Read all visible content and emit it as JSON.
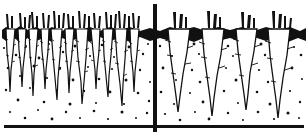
{
  "figure": {
    "medium": "black-and-white pen-and-ink line drawing",
    "canvas": {
      "width": 308,
      "height": 138
    },
    "colors": {
      "ink": "#111111",
      "paper": "#ffffff"
    },
    "divider": {
      "name": "vertical-divider-line",
      "orientation": "vertical",
      "x": 155,
      "y_top": 4,
      "y_bottom": 132,
      "thickness": 4
    },
    "baseline": {
      "name": "ground-baseline",
      "orientation": "horizontal",
      "y": 126,
      "x_start": 4,
      "x_end": 304,
      "thickness": 3
    },
    "soil_surface_y": 34,
    "panels": [
      {
        "id": "left",
        "label": "crowded unthinned carrots",
        "x_start": 0,
        "x_end": 155,
        "carrot_count": 11,
        "spacing": "crowded",
        "root_width": "narrow",
        "root_style": "thin spindly tapering taproots",
        "carrots": [
          {
            "x": 10,
            "top_w": 9,
            "depth": 62,
            "tuft": 3
          },
          {
            "x": 22,
            "top_w": 8,
            "depth": 58,
            "tuft": 3
          },
          {
            "x": 33,
            "top_w": 9,
            "depth": 66,
            "tuft": 4
          },
          {
            "x": 45,
            "top_w": 8,
            "depth": 60,
            "tuft": 3
          },
          {
            "x": 56,
            "top_w": 10,
            "depth": 70,
            "tuft": 4
          },
          {
            "x": 69,
            "top_w": 9,
            "depth": 64,
            "tuft": 3
          },
          {
            "x": 81,
            "top_w": 11,
            "depth": 74,
            "tuft": 4
          },
          {
            "x": 95,
            "top_w": 9,
            "depth": 60,
            "tuft": 3
          },
          {
            "x": 107,
            "top_w": 10,
            "depth": 68,
            "tuft": 4
          },
          {
            "x": 120,
            "top_w": 11,
            "depth": 76,
            "tuft": 4
          },
          {
            "x": 134,
            "top_w": 9,
            "depth": 62,
            "tuft": 3
          }
        ]
      },
      {
        "id": "right",
        "label": "well-spaced thinned carrots",
        "x_start": 155,
        "x_end": 308,
        "carrot_count": 4,
        "spacing": "well-spaced",
        "root_width": "broad",
        "root_style": "wide shouldered roots with long tapering taproots",
        "carrots": [
          {
            "x": 178,
            "top_w": 20,
            "depth": 80,
            "tuft": 3
          },
          {
            "x": 212,
            "top_w": 21,
            "depth": 84,
            "tuft": 3
          },
          {
            "x": 246,
            "top_w": 19,
            "depth": 78,
            "tuft": 3
          },
          {
            "x": 278,
            "top_w": 21,
            "depth": 86,
            "tuft": 4
          }
        ]
      }
    ],
    "soil_texture": {
      "name": "stipple-dots",
      "description": "irregular scattered black dots representing soil grains",
      "dot_count": 150,
      "dot_size_min": 1,
      "dot_size_max": 3
    }
  }
}
